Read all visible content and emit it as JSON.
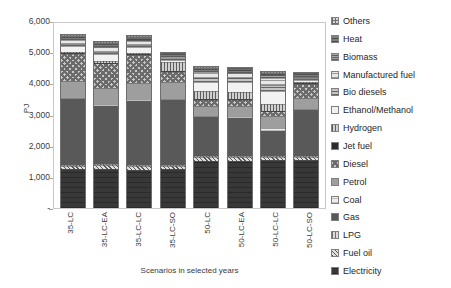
{
  "chart_data": {
    "type": "bar",
    "stacked": true,
    "title": "",
    "xlabel": "Scenarios in selected years",
    "ylabel": "PJ",
    "ylim": [
      0,
      6000
    ],
    "ytick_labels": [
      "-",
      "1,000",
      "2,000",
      "3,000",
      "4,000",
      "5,000",
      "6,000"
    ],
    "ytick_values": [
      0,
      1000,
      2000,
      3000,
      4000,
      5000,
      6000
    ],
    "grid": false,
    "legend_position": "right",
    "categories": [
      "35-LC",
      "35-LC-EA",
      "35-LC-LC",
      "35-LC-SO",
      "50-LC",
      "50-LC-EA",
      "50-LC-LC",
      "50-LC-SO"
    ],
    "series": [
      {
        "name": "Electricity",
        "key": "electricity",
        "color": "#383838",
        "values": [
          1240,
          1260,
          1230,
          1250,
          1520,
          1520,
          1540,
          1530
        ]
      },
      {
        "name": "Fuel oil",
        "key": "fueloil",
        "color": "#e0e0e0",
        "values": [
          110,
          110,
          110,
          110,
          110,
          110,
          110,
          110
        ]
      },
      {
        "name": "LPG",
        "key": "lpg",
        "color": "#dcdcdc",
        "values": [
          30,
          30,
          30,
          30,
          30,
          30,
          30,
          30
        ]
      },
      {
        "name": "Gas",
        "key": "gas",
        "color": "#595959",
        "values": [
          2110,
          1890,
          2080,
          2070,
          1250,
          1240,
          800,
          1480
        ]
      },
      {
        "name": "Coal",
        "key": "coal",
        "color": "#ededed",
        "values": [
          40,
          40,
          40,
          30,
          40,
          40,
          80,
          40
        ]
      },
      {
        "name": "Petrol",
        "key": "petrol",
        "color": "#9e9e9e",
        "values": [
          540,
          520,
          530,
          560,
          330,
          330,
          400,
          330
        ]
      },
      {
        "name": "Diesel",
        "key": "diesel",
        "color": "#c8c8c8",
        "values": [
          870,
          790,
          890,
          320,
          200,
          200,
          140,
          460
        ]
      },
      {
        "name": "Jet fuel",
        "key": "jetfuel",
        "color": "#2b2b2b",
        "values": [
          30,
          30,
          30,
          30,
          30,
          30,
          30,
          30
        ]
      },
      {
        "name": "Hydrogen",
        "key": "hydrogen",
        "color": "#d0d0d0",
        "values": [
          40,
          40,
          40,
          290,
          240,
          240,
          220,
          40
        ]
      },
      {
        "name": "Ethanol/Methanol",
        "key": "ethanol",
        "color": "#f2f2f2",
        "values": [
          200,
          230,
          190,
          60,
          310,
          300,
          420,
          60
        ]
      },
      {
        "name": "Bio diesels",
        "key": "biodiesels",
        "color": "#c4c4c4",
        "values": [
          70,
          80,
          70,
          50,
          120,
          120,
          170,
          50
        ]
      },
      {
        "name": "Manufactured fuel",
        "key": "manufactured",
        "color": "#e8e8e8",
        "values": [
          110,
          140,
          110,
          60,
          180,
          180,
          230,
          60
        ]
      },
      {
        "name": "Biomass",
        "key": "biomass",
        "color": "#a6a6a6",
        "values": [
          60,
          70,
          60,
          40,
          70,
          70,
          90,
          40
        ]
      },
      {
        "name": "Heat",
        "key": "heat",
        "color": "#808080",
        "values": [
          40,
          40,
          40,
          30,
          40,
          40,
          50,
          30
        ]
      },
      {
        "name": "Others",
        "key": "others",
        "color": "#d9d9d9",
        "values": [
          60,
          60,
          60,
          60,
          60,
          60,
          60,
          60
        ]
      }
    ],
    "totals": [
      5550,
      5330,
      5510,
      4890,
      4530,
      4510,
      4370,
      4350
    ]
  },
  "legend": {
    "items": [
      {
        "label": "Others",
        "key": "others"
      },
      {
        "label": "Heat",
        "key": "heat"
      },
      {
        "label": "Biomass",
        "key": "biomass"
      },
      {
        "label": "Manufactured fuel",
        "key": "manufactured"
      },
      {
        "label": "Bio diesels",
        "key": "biodiesels"
      },
      {
        "label": "Ethanol/Methanol",
        "key": "ethanol"
      },
      {
        "label": "Hydrogen",
        "key": "hydrogen"
      },
      {
        "label": "Jet fuel",
        "key": "jetfuel"
      },
      {
        "label": "Diesel",
        "key": "diesel"
      },
      {
        "label": "Petrol",
        "key": "petrol"
      },
      {
        "label": "Coal",
        "key": "coal"
      },
      {
        "label": "Gas",
        "key": "gas"
      },
      {
        "label": "LPG",
        "key": "lpg"
      },
      {
        "label": "Fuel oil",
        "key": "fueloil"
      },
      {
        "label": "Electricity",
        "key": "electricity"
      }
    ]
  }
}
